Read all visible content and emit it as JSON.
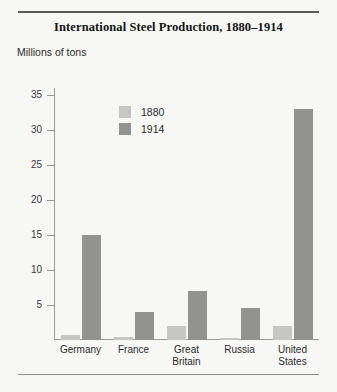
{
  "figure": {
    "title": "International Steel Production, 1880–1914",
    "unit_label": "Millions of tons",
    "background_color": "#f7f7f5"
  },
  "legend": {
    "position": "inside-top-left",
    "entries": [
      {
        "label": "1880",
        "color": "#c6c6c4"
      },
      {
        "label": "1914",
        "color": "#929290"
      }
    ]
  },
  "axis": {
    "y_ticks": [
      5,
      10,
      15,
      20,
      25,
      30,
      35
    ],
    "y_tick_labels": [
      "5",
      "10",
      "15",
      "20",
      "25",
      "30",
      "35"
    ],
    "y_min": 0,
    "y_max": 36,
    "x_categories": [
      "Germany",
      "France",
      "Great Britain",
      "Russia",
      "United States"
    ]
  },
  "chart_data": {
    "type": "bar",
    "title": "International Steel Production, 1880–1914",
    "subtitle": "",
    "xlabel": "",
    "ylabel": "Millions of tons",
    "ylim": [
      0,
      36
    ],
    "yticks": [
      5,
      10,
      15,
      20,
      25,
      30,
      35
    ],
    "grid": false,
    "legend_position": "inside-top-left",
    "categories": [
      "Germany",
      "France",
      "Great Britain",
      "Russia",
      "United States"
    ],
    "series": [
      {
        "name": "1880",
        "color": "#c6c6c4",
        "values": [
          0.7,
          0.4,
          2.0,
          0.3,
          2.0
        ]
      },
      {
        "name": "1914",
        "color": "#929290",
        "values": [
          15.0,
          4.0,
          7.0,
          4.6,
          33.0
        ]
      }
    ]
  },
  "category_labels": [
    {
      "line1": "Germany",
      "line2": ""
    },
    {
      "line1": "France",
      "line2": ""
    },
    {
      "line1": "Great",
      "line2": "Britain"
    },
    {
      "line1": "Russia",
      "line2": ""
    },
    {
      "line1": "United",
      "line2": "States"
    }
  ]
}
